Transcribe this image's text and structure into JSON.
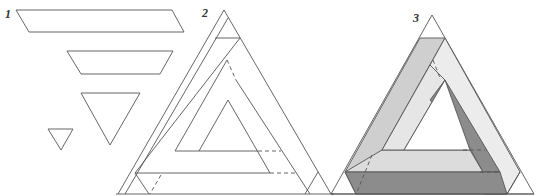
{
  "figure": {
    "panels": [
      {
        "label": "1",
        "content": "Component shapes: long parallelogram, trapezoid, large inverted triangle, small inverted triangle"
      },
      {
        "label": "2",
        "content": "Line drawing of impossible triangle with construction lines"
      },
      {
        "label": "3",
        "content": "Shaded impossible triangle"
      }
    ]
  },
  "colors": {
    "line": "#555555",
    "dark_face": "#8c8c8c",
    "mid_face": "#cfcfcf",
    "light_face": "#ececec",
    "background": "#ffffff"
  }
}
